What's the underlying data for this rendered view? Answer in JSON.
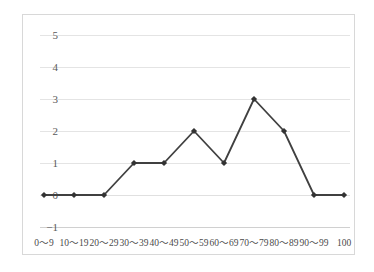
{
  "chart_data": {
    "type": "line",
    "title": "",
    "subtitle": "",
    "xlabel": "",
    "ylabel": "",
    "categories": [
      "0～9",
      "10～19",
      "20～29",
      "30～39",
      "40～49",
      "50～59",
      "60～69",
      "70～79",
      "80～89",
      "90～99",
      "100"
    ],
    "values": [
      0,
      0,
      0,
      1,
      1,
      2,
      1,
      3,
      2,
      0,
      0
    ],
    "series": [
      {
        "name": "",
        "values": [
          0,
          0,
          0,
          1,
          1,
          2,
          1,
          3,
          2,
          0,
          0
        ]
      }
    ],
    "y_ticks": [
      5,
      4,
      3,
      2,
      1,
      0,
      -1
    ],
    "y_tick_labels": [
      "5",
      "4",
      "3",
      "2",
      "1",
      "0",
      "−1"
    ],
    "ylim": [
      -1,
      5
    ],
    "grid": true,
    "legend": false,
    "legend_position": "none",
    "marker": "diamond",
    "line_color": "#404040",
    "marker_color": "#333333",
    "grid_color": "#e4e4e4",
    "axis_text_color": "#4a4a4a",
    "background_color": "#ffffff",
    "frame_color": "#d8d8d8"
  }
}
